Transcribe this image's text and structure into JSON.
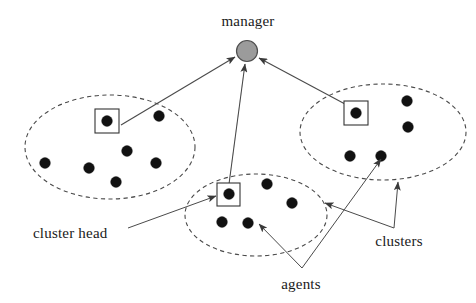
{
  "figure": {
    "type": "hierarchical-cluster-network-diagram",
    "width": 476,
    "height": 303,
    "background_color": "#ffffff"
  },
  "labels": {
    "manager": "manager",
    "cluster_head": "cluster head",
    "agents": "agents",
    "clusters": "clusters"
  },
  "colors": {
    "manager_fill": "#9b9b9b",
    "manager_stroke": "#4e4e4e",
    "agent_dot": "#111111",
    "cluster_outline": "#4a4a4a",
    "head_box_stroke": "#333333",
    "text": "#1a1a1a",
    "arrow": "#4a4a4a"
  },
  "manager": {
    "name": "manager",
    "cx": 247,
    "cy": 51,
    "r": 10.5,
    "label_x": 248,
    "label_y": 26
  },
  "clusters": [
    {
      "id": "cluster-left",
      "cx": 110,
      "cy": 147,
      "rx": 85,
      "ry": 52,
      "head": {
        "cx": 107,
        "cy": 121,
        "box": 24
      },
      "agents": [
        {
          "cx": 159,
          "cy": 116
        },
        {
          "cx": 127,
          "cy": 151
        },
        {
          "cx": 45,
          "cy": 163
        },
        {
          "cx": 89,
          "cy": 168
        },
        {
          "cx": 156,
          "cy": 163
        },
        {
          "cx": 116,
          "cy": 182
        }
      ]
    },
    {
      "id": "cluster-right",
      "cx": 383,
      "cy": 132,
      "rx": 83,
      "ry": 48,
      "head": {
        "cx": 356,
        "cy": 113,
        "box": 24
      },
      "agents": [
        {
          "cx": 407,
          "cy": 101
        },
        {
          "cx": 408,
          "cy": 127
        },
        {
          "cx": 350,
          "cy": 156
        },
        {
          "cx": 381,
          "cy": 156
        }
      ]
    },
    {
      "id": "cluster-middle",
      "cx": 256,
      "cy": 215,
      "rx": 71,
      "ry": 41,
      "head": {
        "cx": 229,
        "cy": 194,
        "box": 23
      },
      "agents": [
        {
          "cx": 267,
          "cy": 184
        },
        {
          "cx": 292,
          "cy": 203
        },
        {
          "cx": 222,
          "cy": 222
        },
        {
          "cx": 248,
          "cy": 223
        }
      ]
    }
  ],
  "uplinks": [
    {
      "id": "uplink-left",
      "from_x": 121,
      "from_y": 125,
      "to_x": 235,
      "to_y": 57
    },
    {
      "id": "uplink-middle",
      "from_x": 229,
      "from_y": 184,
      "to_x": 245,
      "to_y": 64
    },
    {
      "id": "uplink-right",
      "from_x": 345,
      "from_y": 104,
      "to_x": 259,
      "to_y": 58
    }
  ],
  "annotations": [
    {
      "id": "annot-cluster-head",
      "text": "cluster head",
      "text_x": 33,
      "text_y": 238,
      "anchor": "start",
      "path": "M 128,228 L 216,196",
      "arrow_at": {
        "x": 216,
        "y": 196,
        "angle": -20
      }
    },
    {
      "id": "annot-agents",
      "text": "agents",
      "text_x": 301,
      "text_y": 289,
      "anchor": "middle",
      "junction": {
        "x": 302,
        "y": 268
      },
      "path_a": "M 302,268 L 259,224",
      "arrow_a": {
        "x": 259,
        "y": 224,
        "angle": -134
      },
      "path_b": "M 302,268 L 381,159",
      "arrow_b": {
        "x": 381,
        "y": 159,
        "angle": -54
      }
    },
    {
      "id": "annot-clusters",
      "text": "clusters",
      "text_x": 399,
      "text_y": 246,
      "anchor": "middle",
      "junction": {
        "x": 394,
        "y": 228
      },
      "path_a": "M 394,228 L 398,182",
      "arrow_a": {
        "x": 398,
        "y": 182,
        "angle": -85
      },
      "path_b": "M 394,228 L 325,203",
      "arrow_b": {
        "x": 325,
        "y": 203,
        "angle": 200
      }
    }
  ]
}
